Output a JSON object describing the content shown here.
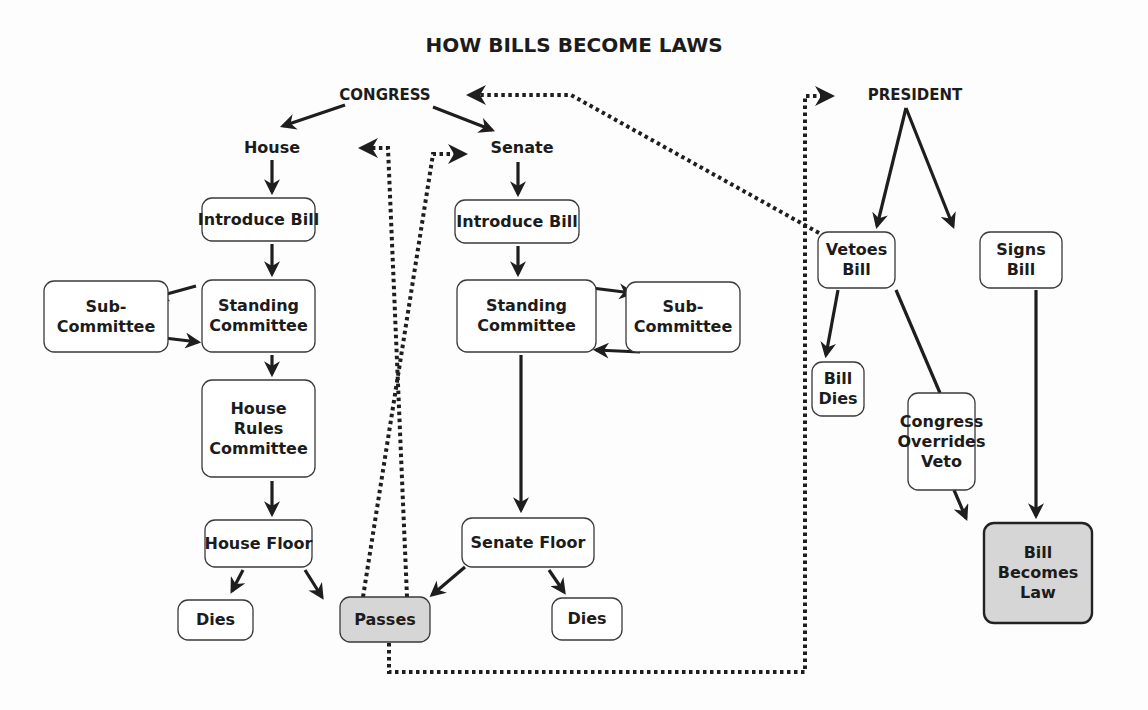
{
  "title": "HOW BILLS BECOME LAWS",
  "labels": [
    {
      "id": "congress",
      "text": "CONGRESS",
      "x": 385,
      "y": 100,
      "cap": true
    },
    {
      "id": "house",
      "text": "House",
      "x": 272,
      "y": 153,
      "cap": false
    },
    {
      "id": "senate",
      "text": "Senate",
      "x": 522,
      "y": 153,
      "cap": false
    },
    {
      "id": "president",
      "text": "PRESIDENT",
      "x": 915,
      "y": 100,
      "cap": true
    }
  ],
  "nodes": [
    {
      "id": "house-introduce",
      "lines": [
        "Introduce Bill"
      ],
      "x": 202,
      "y": 198,
      "w": 113,
      "h": 43
    },
    {
      "id": "house-standing",
      "lines": [
        "Standing",
        "Committee"
      ],
      "x": 202,
      "y": 280,
      "w": 113,
      "h": 72
    },
    {
      "id": "house-sub",
      "lines": [
        "Sub-",
        "Committee"
      ],
      "x": 44,
      "y": 281,
      "w": 124,
      "h": 71
    },
    {
      "id": "house-rules",
      "lines": [
        "House",
        "Rules",
        "Committee"
      ],
      "x": 202,
      "y": 380,
      "w": 113,
      "h": 97
    },
    {
      "id": "house-floor",
      "lines": [
        "House Floor"
      ],
      "x": 205,
      "y": 520,
      "w": 107,
      "h": 47
    },
    {
      "id": "house-dies",
      "lines": [
        "Dies"
      ],
      "x": 178,
      "y": 600,
      "w": 75,
      "h": 40
    },
    {
      "id": "passes",
      "lines": [
        "Passes"
      ],
      "x": 340,
      "y": 597,
      "w": 90,
      "h": 45,
      "shaded": true
    },
    {
      "id": "senate-introduce",
      "lines": [
        "Introduce Bill"
      ],
      "x": 455,
      "y": 200,
      "w": 124,
      "h": 43
    },
    {
      "id": "senate-standing",
      "lines": [
        "Standing",
        "Committee"
      ],
      "x": 457,
      "y": 280,
      "w": 139,
      "h": 72
    },
    {
      "id": "senate-sub",
      "lines": [
        "Sub-",
        "Committee"
      ],
      "x": 626,
      "y": 282,
      "w": 114,
      "h": 70
    },
    {
      "id": "senate-floor",
      "lines": [
        "Senate Floor"
      ],
      "x": 462,
      "y": 518,
      "w": 132,
      "h": 49
    },
    {
      "id": "senate-dies",
      "lines": [
        "Dies"
      ],
      "x": 552,
      "y": 598,
      "w": 70,
      "h": 42
    },
    {
      "id": "vetoes",
      "lines": [
        "Vetoes",
        "Bill"
      ],
      "x": 818,
      "y": 232,
      "w": 77,
      "h": 56
    },
    {
      "id": "signs",
      "lines": [
        "Signs",
        "Bill"
      ],
      "x": 980,
      "y": 232,
      "w": 82,
      "h": 56
    },
    {
      "id": "bill-dies",
      "lines": [
        "Bill",
        "Dies"
      ],
      "x": 812,
      "y": 362,
      "w": 52,
      "h": 54
    },
    {
      "id": "override",
      "lines": [
        "Congress",
        "Overrides",
        "Veto"
      ],
      "x": 908,
      "y": 393,
      "w": 67,
      "h": 97
    },
    {
      "id": "becomes-law",
      "lines": [
        "Bill",
        "Becomes",
        "Law"
      ],
      "x": 984,
      "y": 523,
      "w": 108,
      "h": 100,
      "shaded": true,
      "bold": true
    }
  ],
  "edges": [
    {
      "from": "congress",
      "to": "house",
      "d": "M345 105 L283 126",
      "arrow": true
    },
    {
      "from": "congress",
      "to": "senate",
      "d": "M433 107 L492 130",
      "arrow": true
    },
    {
      "from": "house",
      "to": "house-introduce",
      "d": "M272 160 L272 192",
      "arrow": true
    },
    {
      "from": "house-introduce",
      "to": "house-standing",
      "d": "M272 244 L272 274",
      "arrow": true
    },
    {
      "from": "house-standing",
      "to": "house-sub",
      "d": "M196 286 L156 297",
      "arrow": true
    },
    {
      "from": "house-sub",
      "to": "house-standing",
      "d": "M156 337 L198 342",
      "arrow": true
    },
    {
      "from": "house-standing",
      "to": "house-rules",
      "d": "M272 355 L272 374",
      "arrow": true
    },
    {
      "from": "house-rules",
      "to": "house-floor",
      "d": "M272 481 L272 514",
      "arrow": true
    },
    {
      "from": "house-floor",
      "to": "house-dies",
      "d": "M243 570 L232 591",
      "arrow": true
    },
    {
      "from": "house-floor",
      "to": "passes",
      "d": "M305 570 L322 597",
      "arrow": true
    },
    {
      "from": "senate",
      "to": "senate-introduce",
      "d": "M518 162 L518 194",
      "arrow": true
    },
    {
      "from": "senate-introduce",
      "to": "senate-standing",
      "d": "M518 246 L518 274",
      "arrow": true
    },
    {
      "from": "senate-standing",
      "to": "senate-sub",
      "d": "M592 288 L632 293",
      "arrow": true
    },
    {
      "from": "senate-sub",
      "to": "senate-standing",
      "d": "M640 352 L596 350",
      "arrow": true
    },
    {
      "from": "senate-standing",
      "to": "senate-floor",
      "d": "M521 355 L521 510",
      "arrow": true
    },
    {
      "from": "senate-floor",
      "to": "passes",
      "d": "M465 567 L432 595",
      "arrow": true
    },
    {
      "from": "senate-floor",
      "to": "senate-dies",
      "d": "M549 570 L564 592",
      "arrow": true
    },
    {
      "from": "president",
      "to": "vetoes",
      "d": "M906 108 L877 226",
      "arrow": true
    },
    {
      "from": "president",
      "to": "signs",
      "d": "M906 108 L953 226",
      "arrow": true
    },
    {
      "from": "vetoes",
      "to": "bill-dies",
      "d": "M838 290 L826 355",
      "arrow": true
    },
    {
      "from": "vetoes",
      "to": "override",
      "d": "M896 290 L940 393",
      "arrow": false
    },
    {
      "from": "signs",
      "to": "becomes-law",
      "d": "M1036 290 L1036 516",
      "arrow": true
    },
    {
      "from": "override",
      "to": "becomes-law",
      "d": "M954 490 L966 518",
      "arrow": true
    }
  ],
  "dotted_edges": [
    {
      "from": "passes",
      "to": "house",
      "d": "M407 597 L388 148 L362 148",
      "arrow": "left"
    },
    {
      "from": "passes",
      "to": "senate",
      "d": "M363 597 L433 154 L464 154",
      "arrow": "right"
    },
    {
      "from": "passes",
      "to": "president",
      "d": "M389 643 L389 672 L805 672 L805 96 L831 96",
      "arrow": "right"
    },
    {
      "from": "vetoes",
      "to": "congress",
      "d": "M819 233 L571 95 L470 95",
      "arrow": "left"
    }
  ]
}
